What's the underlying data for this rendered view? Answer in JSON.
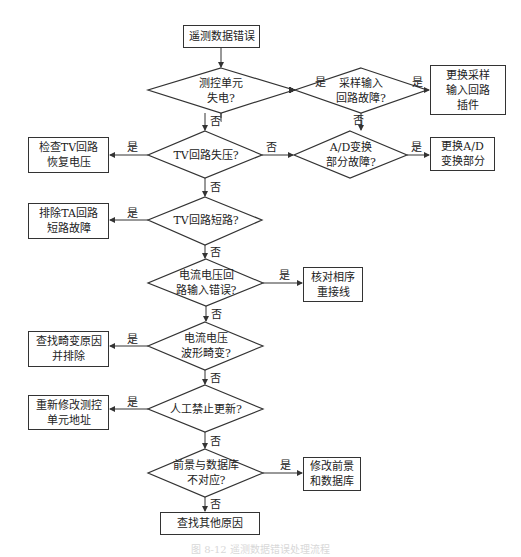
{
  "title": "遥测数据错误处理流程",
  "yes_label": "是",
  "no_label": "否",
  "start": "遥测数据错误",
  "decisions": {
    "d1": "测控单元\n失电?",
    "d2": "采样输入\n回路故障?",
    "d3": "TV回路失压?",
    "d4": "A/D变换\n部分故障?",
    "d5": "TV回路短路?",
    "d6": "电流电压回\n路输入错误?",
    "d7": "电流电压\n波形畸变?",
    "d8": "人工禁止更新?",
    "d9": "前景与数据库\n不对应?"
  },
  "actions": {
    "a2": "更换采样\n输入回路\n插件",
    "a3": "检查TV回路\n恢复电压",
    "a4": "更换A/D\n变换部分",
    "a5": "排除TA回路\n短路故障",
    "a6": "核对相序\n重接线",
    "a7": "查找畸变原因\n并排除",
    "a8": "重新修改测控\n单元地址",
    "a9": "修改前景\n和数据库",
    "end": "查找其他原因"
  },
  "caption": "图 8-12  遥测数据错误处理流程"
}
